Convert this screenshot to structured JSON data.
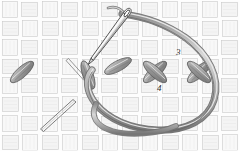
{
  "figure": {
    "medium": "pencil sketch / line drawing",
    "background_color": "#fefefe"
  },
  "labels": [
    {
      "id": "label-3",
      "text": "3",
      "x": 176,
      "y": 48
    },
    {
      "id": "label-4",
      "text": "4",
      "x": 157,
      "y": 84
    }
  ],
  "colors": {
    "fabric_line": "#b9b9b9",
    "fabric_fill": "#f6f6f6",
    "fabric_shade": "#ececec",
    "thread_outline": "#6e6e6e",
    "thread_fill": "#c2c2c2",
    "thread_highlight": "#e6e6e6",
    "stitch_outline": "#5a5a5a",
    "stitch_fill": "#b0b0b0",
    "needle_outline": "#4a4a4a",
    "needle_fill": "#f2f2f2",
    "label_color": "#2b2b2b"
  },
  "fabric": {
    "name": "basket-weave canvas",
    "columns": 12,
    "rows": 8,
    "cell_width": 20,
    "cell_height": 19
  },
  "elements": {
    "needle": {
      "name": "sewing-needle",
      "tip_x": 92,
      "tip_y": 62,
      "eye_x": 126,
      "eye_y": 12,
      "angle_deg": -55
    },
    "thread": {
      "name": "embroidery-thread",
      "description": "single strand looping from needle eye over the top, around the right and back under the bottom"
    },
    "cross_stitches": [
      {
        "name": "cross-stitch-middle",
        "cx": 155,
        "cy": 72
      },
      {
        "name": "cross-stitch-right",
        "cx": 199,
        "cy": 72
      }
    ],
    "half_stitches": [
      {
        "name": "half-stitch-left",
        "cx": 22,
        "cy": 72
      },
      {
        "name": "half-stitch-center",
        "cx": 88,
        "cy": 74
      },
      {
        "name": "half-stitch-upper-right",
        "cx": 120,
        "cy": 68
      }
    ],
    "guide_lines": [
      {
        "name": "guide-stitch-upper",
        "x1": 70,
        "y1": 60,
        "x2": 86,
        "y2": 78
      },
      {
        "name": "guide-stitch-lower",
        "x1": 40,
        "y1": 128,
        "x2": 72,
        "y2": 100
      }
    ]
  }
}
